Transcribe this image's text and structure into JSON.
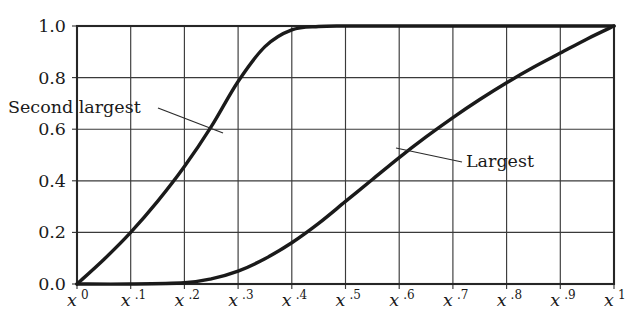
{
  "chart_data": {
    "type": "line",
    "title": "",
    "subtitle": "",
    "xlabel": "",
    "ylabel": "",
    "xlim": [
      0,
      1
    ],
    "ylim": [
      0,
      1
    ],
    "grid": true,
    "legend_position": "inline-annotations",
    "x_tick_labels": [
      {
        "base": "x",
        "exponent": "0"
      },
      {
        "base": "x",
        "exponent": ".1"
      },
      {
        "base": "x",
        "exponent": ".2"
      },
      {
        "base": "x",
        "exponent": ".3"
      },
      {
        "base": "x",
        "exponent": ".4"
      },
      {
        "base": "x",
        "exponent": ".5"
      },
      {
        "base": "x",
        "exponent": ".6"
      },
      {
        "base": "x",
        "exponent": ".7"
      },
      {
        "base": "x",
        "exponent": ".8"
      },
      {
        "base": "x",
        "exponent": ".9"
      },
      {
        "base": "x",
        "exponent": "1"
      }
    ],
    "x_tick_values": [
      0,
      0.1,
      0.2,
      0.3,
      0.4,
      0.5,
      0.6,
      0.7,
      0.8,
      0.9,
      1.0
    ],
    "y_tick_labels": [
      "0.0",
      "0.2",
      "0.4",
      "0.6",
      "0.8",
      "1.0"
    ],
    "y_tick_values": [
      0.0,
      0.2,
      0.4,
      0.6,
      0.8,
      1.0
    ],
    "series": [
      {
        "name": "Second largest",
        "annotation": "Second largest",
        "x": [
          0.0,
          0.05,
          0.1,
          0.15,
          0.2,
          0.25,
          0.3,
          0.35,
          0.4,
          0.45,
          0.5,
          0.6,
          0.7,
          0.8,
          0.9,
          1.0
        ],
        "values": [
          0.0,
          0.095,
          0.2,
          0.32,
          0.455,
          0.61,
          0.785,
          0.92,
          0.985,
          0.998,
          1.0,
          1.0,
          1.0,
          1.0,
          1.0,
          1.0
        ]
      },
      {
        "name": "Largest",
        "annotation": "Largest",
        "x": [
          0.0,
          0.1,
          0.2,
          0.25,
          0.3,
          0.35,
          0.4,
          0.45,
          0.5,
          0.55,
          0.6,
          0.65,
          0.7,
          0.75,
          0.8,
          0.85,
          0.9,
          0.95,
          1.0
        ],
        "values": [
          0.0,
          0.0,
          0.005,
          0.02,
          0.05,
          0.098,
          0.16,
          0.235,
          0.32,
          0.405,
          0.49,
          0.57,
          0.645,
          0.715,
          0.78,
          0.84,
          0.895,
          0.95,
          1.0
        ]
      }
    ],
    "annotations": [
      {
        "label": "Second largest",
        "x_px": 8,
        "y_px": 113,
        "leader_from": [
          158,
          108
        ],
        "leader_to": [
          223,
          133
        ]
      },
      {
        "label": "Largest",
        "x_px": 466,
        "y_px": 167,
        "leader_from": [
          462,
          162
        ],
        "leader_to": [
          396,
          148
        ]
      }
    ]
  }
}
